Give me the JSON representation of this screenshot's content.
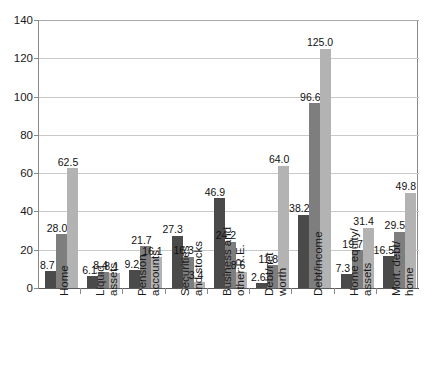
{
  "chart_data": {
    "type": "bar",
    "title": "",
    "subtitle": "",
    "xlabel": "",
    "ylabel": "",
    "ylim": [
      0,
      140
    ],
    "ytick_step": 20,
    "yticks": [
      0,
      20,
      40,
      60,
      80,
      100,
      120,
      140
    ],
    "grid": true,
    "legend": false,
    "legend_position": "none",
    "orientation": "vertical",
    "group_count": 9,
    "series_count": 3,
    "categories": [
      "Home",
      "Liquid assets",
      "Pension accounts",
      "Securities and stocks",
      "Business and other R.E.",
      "Debt/net worth",
      "Debt/income",
      "Home equity/ assets",
      "Mort. debt/ home"
    ],
    "category_label_lines": [
      [
        "Home"
      ],
      [
        "Liquid",
        "assets"
      ],
      [
        "Pension",
        "accounts"
      ],
      [
        "Securities",
        "and stocks"
      ],
      [
        "Business and",
        "other R.E."
      ],
      [
        "Debt/net",
        "worth"
      ],
      [
        "Debt/income"
      ],
      [
        "Home equity/",
        "assets"
      ],
      [
        "Mort. debt/",
        "home"
      ]
    ],
    "series": [
      {
        "name": "series-1",
        "color": "#4a4a4a",
        "values": [
          8.7,
          6.1,
          9.2,
          27.3,
          46.9,
          2.6,
          38.2,
          7.3,
          16.5
        ]
      },
      {
        "name": "series-2",
        "color": "#7e7e7e",
        "values": [
          28.0,
          8.4,
          21.7,
          16.3,
          24.2,
          11.8,
          96.6,
          19.7,
          29.5
        ]
      },
      {
        "name": "series-3",
        "color": "#b3b3b3",
        "values": [
          62.5,
          8.1,
          16.1,
          3.4,
          8.6,
          64.0,
          125.0,
          31.4,
          49.8
        ]
      }
    ],
    "value_labels": [
      [
        "8.7",
        "28.0",
        "62.5"
      ],
      [
        "6.1",
        "8.4",
        "8.1"
      ],
      [
        "9.2",
        "21.7",
        "16.1"
      ],
      [
        "27.3",
        "16.3",
        "3.4"
      ],
      [
        "46.9",
        "24.2",
        "8.6"
      ],
      [
        "2.6",
        "11.8",
        "64.0"
      ],
      [
        "38.2",
        "96.6",
        "125.0"
      ],
      [
        "7.3",
        "19.7",
        "31.4"
      ],
      [
        "16.5",
        "29.5",
        "49.8"
      ]
    ],
    "ytick_labels": [
      "0",
      "20",
      "40",
      "60",
      "80",
      "100",
      "120",
      "140"
    ],
    "colors": {
      "series_1": "#4a4a4a",
      "series_2": "#7e7e7e",
      "series_3": "#b3b3b3",
      "gridline": "#c9c9c9",
      "axis": "#8a8a8a",
      "text": "#1a1a1a",
      "background": "#ffffff"
    }
  }
}
